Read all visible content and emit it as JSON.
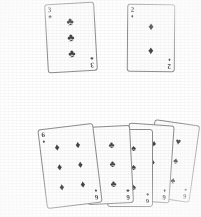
{
  "scene": {
    "background_color": "#ffffff",
    "ink_color": "#454545",
    "border_color": "#8e8e8e",
    "description": "Scanned grayscale photograph of playing cards: two single cards on top and a fan of five overlapping cards below"
  },
  "suit_glyphs": {
    "clubs": "♣",
    "diamonds": "♦",
    "hearts": "♥",
    "spades": "♠"
  },
  "top_row": {
    "cards": [
      {
        "id": "card-3-clubs",
        "rank": "3",
        "suit": "clubs",
        "suit_glyph": "♣",
        "pip_count": 3,
        "rotation_deg": -3.2
      },
      {
        "id": "card-2-diamonds",
        "rank": "2",
        "suit": "diamonds",
        "suit_glyph": "♦",
        "pip_count": 2,
        "rotation_deg": 0.4
      }
    ]
  },
  "fan": {
    "card_count": 5,
    "cards": [
      {
        "id": "fan-card-1",
        "rank": "6",
        "suit": "diamonds",
        "suit_glyph": "♦",
        "pip_count": 6,
        "rotation_deg": -7,
        "occluded": false
      },
      {
        "id": "fan-card-2",
        "rank": "6",
        "suit": "clubs",
        "suit_glyph": "♣",
        "visible_pips": 3,
        "rotation_deg": -3,
        "occluded": true
      },
      {
        "id": "fan-card-3",
        "rank": "6",
        "suit": "spades",
        "suit_glyph": "♠",
        "visible_pips": 3,
        "rotation_deg": 0,
        "occluded": true
      },
      {
        "id": "fan-card-4",
        "rank": "6",
        "suit": "diamonds",
        "suit_glyph": "♦",
        "visible_pips": 3,
        "rotation_deg": 4,
        "occluded": true
      },
      {
        "id": "fan-card-5",
        "rank": "6",
        "suit": "spades",
        "suit_glyph": "♠",
        "visible_pips": 3,
        "top_pip_suit": "hearts",
        "top_pip_glyph": "♥",
        "rotation_deg": 8,
        "occluded": true
      }
    ]
  }
}
